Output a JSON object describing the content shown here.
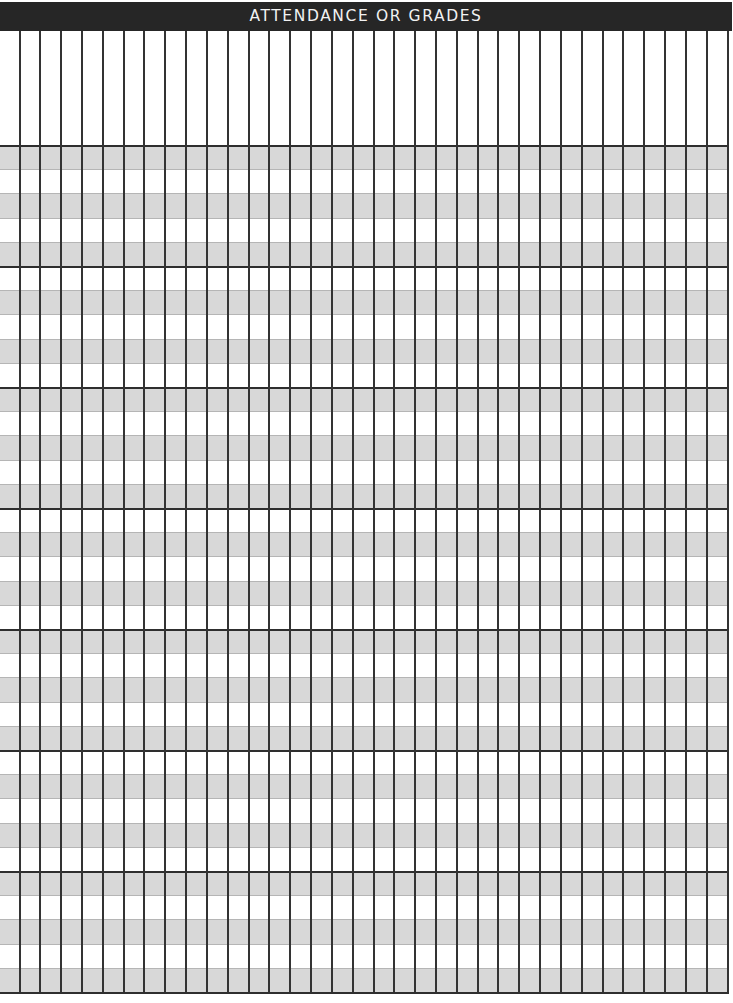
{
  "document": {
    "title": "ATTENDANCE OR GRADES",
    "colors": {
      "header_background": "#262626",
      "header_text": "#f2f2f2",
      "band_gray": "#d8d8d8",
      "band_white": "#ffffff",
      "grid_line": "#333333"
    },
    "grid": {
      "column_count": 34,
      "vertical_line_count": 35,
      "header_area_height_px": 115,
      "row_groups": 7,
      "rows_per_group": 5,
      "total_rows": 35,
      "band_pattern": "alternating, starting gray",
      "cells": []
    }
  }
}
